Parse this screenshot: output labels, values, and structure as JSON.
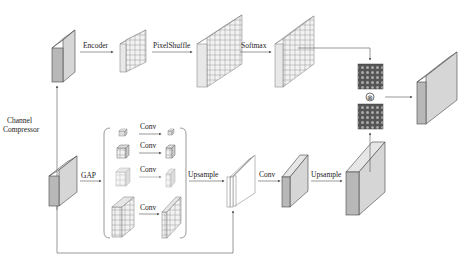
{
  "diagram": {
    "labels": {
      "encoder": "Encoder",
      "pixelshuffle": "PixelShuffle",
      "softmax": "Softmax",
      "channel_compressor_1": "Channel",
      "channel_compressor_2": "Compressor",
      "gap": "GAP",
      "conv1": "Conv",
      "conv2": "Conv",
      "conv3": "Conv",
      "conv4": "Conv",
      "upsample1": "Upsample",
      "conv5": "Conv",
      "upsample2": "Upsample",
      "multiply": "⊗"
    },
    "colors": {
      "block_front": "#b8b8b8",
      "block_side": "#d6d6d6",
      "grid_fill": "#eeeeee",
      "kernel_fill": "#555555",
      "line": "#555555"
    }
  }
}
